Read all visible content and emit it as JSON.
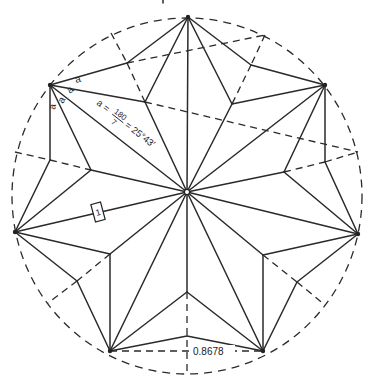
{
  "figure": {
    "center": [
      187,
      192
    ],
    "radius": 178,
    "circle_center": [
      187,
      196
    ],
    "star_points": [
      [
        188,
        17
      ],
      [
        325,
        85
      ],
      [
        358,
        234
      ],
      [
        263,
        351
      ],
      [
        110,
        351
      ],
      [
        15,
        232
      ],
      [
        50,
        85
      ]
    ],
    "outer_valleys": [
      [
        251,
        65
      ],
      [
        325,
        162
      ],
      [
        297,
        282
      ],
      [
        187,
        336
      ],
      [
        77,
        281
      ],
      [
        50,
        160
      ],
      [
        127,
        63
      ]
    ],
    "inner_valleys": [
      [
        232,
        104
      ],
      [
        284,
        172
      ],
      [
        263,
        255
      ],
      [
        187,
        292
      ],
      [
        110,
        254
      ],
      [
        91,
        170
      ],
      [
        145,
        102
      ]
    ]
  },
  "labels": {
    "angle_symbol_1": "a",
    "angle_symbol_2": "a",
    "angle_symbol_3": "a",
    "angle_symbol_4": "a",
    "formula_lhs": "a =",
    "formula_num": "180",
    "formula_den": "7",
    "formula_rhs": "= 25°43′",
    "unit_length": "1",
    "chord_length": "0.8678"
  }
}
